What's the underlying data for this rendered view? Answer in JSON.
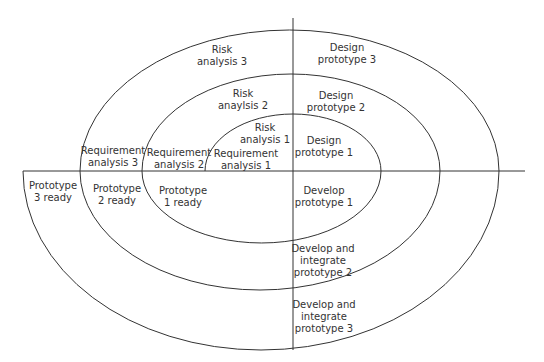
{
  "diagram": {
    "type": "spiral-model",
    "line_color": "#333333",
    "axes": {
      "vertical": {
        "x": 293,
        "y1": 18,
        "y2": 350
      },
      "horizontal": {
        "y": 171,
        "x1": 23,
        "x2": 525
      }
    },
    "labels": {
      "risk_analysis_3": "Risk\nanalysis 3",
      "risk_analysis_2": "Risk\nanaylsis 2",
      "risk_analysis_1": "Risk\nanalysis 1",
      "requirement_analysis_3": "Requirement\nanalysis 3",
      "requirement_analysis_2": "Requirement\nanalysis 2",
      "requirement_analysis_1": "Requirement\nanalysis 1",
      "design_prototype_3": "Design\nprototype 3",
      "design_prototype_2": "Design\nprototype 2",
      "design_prototype_1": "Design\nprototype 1",
      "prototype_3_ready": "Prototype\n3 ready",
      "prototype_2_ready": "Prototype\n2 ready",
      "prototype_1_ready": "Prototype\n1 ready",
      "develop_prototype_1": "Develop\nprototype 1",
      "develop_integrate_prototype_2": "Develop and\nintegrate\nprototype 2",
      "develop_integrate_prototype_3": "Develop and\nintegrate\nprototype 3"
    },
    "quadrants": [
      "Requirement / Risk analysis",
      "Design",
      "Develop / Integrate",
      "Prototype ready"
    ]
  }
}
